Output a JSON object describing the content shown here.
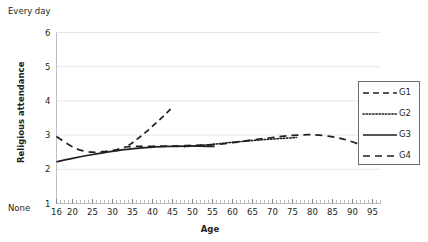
{
  "chart_data": {
    "type": "line",
    "title": "",
    "xlabel": "Age",
    "ylabel": "Religious attendance",
    "y_top_label": "Every day",
    "y_bottom_label": "None",
    "xlim": [
      16,
      97
    ],
    "ylim": [
      1,
      6
    ],
    "grid": true,
    "grid_axis": "y",
    "legend_position": "right",
    "xticks": [
      16,
      20,
      25,
      30,
      35,
      40,
      45,
      50,
      55,
      60,
      65,
      70,
      75,
      80,
      85,
      90,
      95
    ],
    "xtick_labels": [
      "16",
      "20",
      "25",
      "30",
      "35",
      "40",
      "45",
      "50",
      "55",
      "60",
      "65",
      "70",
      "75",
      "80",
      "85",
      "90",
      "95"
    ],
    "yticks": [
      1,
      2,
      3,
      4,
      5,
      6
    ],
    "ytick_labels": [
      "1",
      "2",
      "3",
      "4",
      "5",
      "6"
    ],
    "series": [
      {
        "name": "G1",
        "style": "dashed",
        "color": "#231f20",
        "points": [
          [
            34.0,
            2.7
          ],
          [
            35.5,
            2.82
          ],
          [
            37.0,
            2.96
          ],
          [
            38.5,
            3.1
          ],
          [
            40.0,
            3.26
          ],
          [
            41.5,
            3.42
          ],
          [
            43.0,
            3.58
          ],
          [
            44.5,
            3.76
          ]
        ]
      },
      {
        "name": "G2",
        "style": "dotted",
        "color": "#231f20",
        "points": [
          [
            48.0,
            2.66
          ],
          [
            52.0,
            2.7
          ],
          [
            56.0,
            2.74
          ],
          [
            60.0,
            2.79
          ],
          [
            64.0,
            2.83
          ],
          [
            68.0,
            2.87
          ],
          [
            72.0,
            2.9
          ],
          [
            76.0,
            2.93
          ]
        ]
      },
      {
        "name": "G3",
        "style": "solid",
        "color": "#231f20",
        "points": [
          [
            16.0,
            2.22
          ],
          [
            20.0,
            2.32
          ],
          [
            24.0,
            2.41
          ],
          [
            28.0,
            2.49
          ],
          [
            32.0,
            2.56
          ],
          [
            36.0,
            2.61
          ],
          [
            40.0,
            2.65
          ],
          [
            44.0,
            2.67
          ],
          [
            48.0,
            2.68
          ],
          [
            52.0,
            2.68
          ],
          [
            55.5,
            2.67
          ]
        ]
      },
      {
        "name": "G4",
        "style": "longdash",
        "color": "#231f20",
        "points": [
          [
            16.0,
            2.96
          ],
          [
            18.0,
            2.8
          ],
          [
            20.0,
            2.66
          ],
          [
            22.0,
            2.56
          ],
          [
            25.0,
            2.5
          ],
          [
            28.0,
            2.52
          ],
          [
            31.0,
            2.57
          ],
          [
            34.0,
            2.66
          ],
          [
            45.0,
            2.68
          ],
          [
            50.0,
            2.7
          ],
          [
            55.0,
            2.72
          ],
          [
            60.0,
            2.78
          ],
          [
            65.0,
            2.86
          ],
          [
            70.0,
            2.93
          ],
          [
            75.0,
            2.99
          ],
          [
            80.0,
            3.01
          ],
          [
            85.0,
            2.95
          ],
          [
            89.0,
            2.84
          ],
          [
            93.0,
            2.67
          ]
        ]
      }
    ],
    "legend_entries": [
      {
        "label": "G1",
        "style": "dashed"
      },
      {
        "label": "G2",
        "style": "dotted"
      },
      {
        "label": "G3",
        "style": "solid"
      },
      {
        "label": "G4",
        "style": "longdash"
      }
    ]
  }
}
